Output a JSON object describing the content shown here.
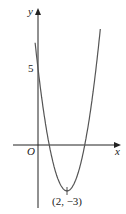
{
  "chart_data": {
    "type": "line",
    "title": "",
    "xlabel": "x",
    "ylabel": "y",
    "origin_label": "O",
    "function": "y = 2(x-2)^2 - 3",
    "annotations": [
      {
        "text": "5",
        "x": 0,
        "y": 5,
        "note": "y-intercept"
      },
      {
        "text": "(2, −3)",
        "x": 2,
        "y": -3,
        "note": "vertex"
      }
    ],
    "series": [
      {
        "name": "parabola",
        "x": [
          -0.2,
          0,
          0.5,
          1,
          1.5,
          2,
          2.5,
          3,
          3.5,
          4,
          4.3
        ],
        "y": [
          6.68,
          5,
          1.5,
          -1,
          -2.5,
          -3,
          -2.5,
          -1,
          1.5,
          5,
          7.58
        ]
      }
    ],
    "grid": false
  },
  "labels": {
    "y_axis": "y",
    "x_axis": "x",
    "origin": "O",
    "y_tick": "5",
    "vertex": "(2, −3)"
  }
}
